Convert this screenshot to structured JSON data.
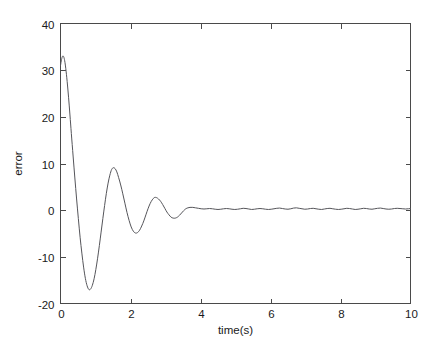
{
  "chart_data": {
    "type": "line",
    "title": "",
    "xlabel": "time(s)",
    "ylabel": "error",
    "xlim": [
      0,
      10
    ],
    "ylim": [
      -20,
      40
    ],
    "xticks": [
      0,
      2,
      4,
      6,
      8,
      10
    ],
    "yticks": [
      -20,
      -10,
      0,
      10,
      20,
      30,
      40
    ],
    "xtick_labels": [
      "0",
      "2",
      "4",
      "6",
      "8",
      "10"
    ],
    "ytick_labels": [
      "-20",
      "-10",
      "0",
      "10",
      "20",
      "30",
      "40"
    ],
    "grid": false,
    "legend": null,
    "series": [
      {
        "name": "error",
        "color": "#55555a",
        "description": "damped oscillatory tracking error decaying to near zero with small residual ripple",
        "x": [
          0.0,
          0.03,
          0.06,
          0.09,
          0.12,
          0.15,
          0.19,
          0.23,
          0.27,
          0.31,
          0.36,
          0.41,
          0.46,
          0.51,
          0.56,
          0.61,
          0.66,
          0.71,
          0.76,
          0.81,
          0.86,
          0.91,
          0.96,
          1.01,
          1.06,
          1.11,
          1.16,
          1.21,
          1.26,
          1.31,
          1.36,
          1.41,
          1.46,
          1.51,
          1.56,
          1.61,
          1.66,
          1.72,
          1.78,
          1.84,
          1.9,
          1.96,
          2.02,
          2.08,
          2.14,
          2.2,
          2.26,
          2.32,
          2.38,
          2.44,
          2.5,
          2.56,
          2.62,
          2.68,
          2.74,
          2.8,
          2.86,
          2.92,
          2.98,
          3.04,
          3.1,
          3.16,
          3.22,
          3.28,
          3.34,
          3.4,
          3.46,
          3.52,
          3.58,
          3.64,
          3.7,
          3.78,
          3.86,
          3.94,
          4.02,
          4.1,
          4.18,
          4.26,
          4.34,
          4.42,
          4.5,
          4.58,
          4.66,
          4.74,
          4.82,
          4.9,
          4.98,
          5.06,
          5.14,
          5.22,
          5.3,
          5.38,
          5.46,
          5.54,
          5.62,
          5.7,
          5.78,
          5.86,
          5.94,
          6.02,
          6.1,
          6.18,
          6.26,
          6.34,
          6.42,
          6.5,
          6.58,
          6.66,
          6.74,
          6.82,
          6.9,
          6.98,
          7.06,
          7.14,
          7.22,
          7.3,
          7.38,
          7.46,
          7.54,
          7.62,
          7.7,
          7.78,
          7.86,
          7.94,
          8.02,
          8.1,
          8.18,
          8.26,
          8.34,
          8.42,
          8.5,
          8.58,
          8.66,
          8.74,
          8.82,
          8.9,
          8.98,
          9.06,
          9.14,
          9.22,
          9.3,
          9.38,
          9.46,
          9.54,
          9.62,
          9.7,
          9.78,
          9.86,
          9.94,
          10.0
        ],
        "y": [
          31.0,
          32.3,
          33.0,
          32.9,
          32.0,
          30.4,
          27.6,
          24.2,
          20.4,
          16.4,
          11.6,
          6.9,
          2.4,
          -1.8,
          -5.8,
          -9.2,
          -12.2,
          -14.6,
          -16.2,
          -17.0,
          -16.9,
          -16.1,
          -14.7,
          -12.7,
          -10.3,
          -7.6,
          -4.7,
          -1.8,
          1.0,
          3.6,
          5.8,
          7.5,
          8.7,
          9.1,
          8.9,
          8.2,
          7.0,
          5.4,
          3.5,
          1.5,
          -0.5,
          -2.2,
          -3.6,
          -4.5,
          -4.9,
          -4.8,
          -4.3,
          -3.4,
          -2.3,
          -1.0,
          0.3,
          1.4,
          2.2,
          2.7,
          2.7,
          2.4,
          1.9,
          1.2,
          0.4,
          -0.4,
          -1.0,
          -1.5,
          -1.7,
          -1.7,
          -1.5,
          -1.1,
          -0.6,
          -0.1,
          0.3,
          0.5,
          0.6,
          0.6,
          0.5,
          0.4,
          0.3,
          0.25,
          0.3,
          0.35,
          0.3,
          0.2,
          0.15,
          0.2,
          0.3,
          0.35,
          0.3,
          0.2,
          0.15,
          0.2,
          0.3,
          0.4,
          0.35,
          0.25,
          0.15,
          0.2,
          0.3,
          0.35,
          0.3,
          0.2,
          0.15,
          0.2,
          0.3,
          0.4,
          0.45,
          0.35,
          0.25,
          0.2,
          0.3,
          0.45,
          0.5,
          0.4,
          0.3,
          0.2,
          0.25,
          0.35,
          0.4,
          0.3,
          0.2,
          0.15,
          0.25,
          0.35,
          0.4,
          0.3,
          0.2,
          0.15,
          0.2,
          0.3,
          0.4,
          0.35,
          0.25,
          0.15,
          0.2,
          0.3,
          0.4,
          0.35,
          0.25,
          0.2,
          0.3,
          0.4,
          0.45,
          0.35,
          0.25,
          0.2,
          0.25,
          0.35,
          0.4,
          0.35,
          0.3,
          0.25,
          0.3,
          0.35
        ]
      }
    ]
  },
  "axes": {
    "line_color": "#4a4a4a",
    "background": "#ffffff"
  }
}
